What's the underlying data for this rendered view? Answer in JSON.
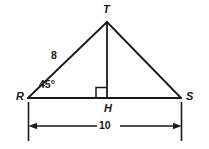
{
  "figure": {
    "type": "geometry-diagram",
    "background_color": "#ffffff",
    "stroke_color": "#1a1a1a",
    "vertices": {
      "T": {
        "label": "T",
        "x": 107,
        "y": 22
      },
      "R": {
        "label": "R",
        "x": 28,
        "y": 98
      },
      "S": {
        "label": "S",
        "x": 181,
        "y": 98
      },
      "H": {
        "label": "H",
        "x": 107,
        "y": 98
      }
    },
    "segments": [
      {
        "name": "RT",
        "from": "R",
        "to": "T"
      },
      {
        "name": "TS",
        "from": "T",
        "to": "S"
      },
      {
        "name": "RS",
        "from": "R",
        "to": "S"
      },
      {
        "name": "TH",
        "from": "T",
        "to": "H"
      }
    ],
    "measures": {
      "side_RT": "8",
      "angle_R": "45°",
      "base_RS": "10"
    },
    "markers": {
      "right_angle_at_H": true
    },
    "dimension": {
      "value": "10",
      "from": "R",
      "to": "S",
      "position": "below"
    }
  }
}
